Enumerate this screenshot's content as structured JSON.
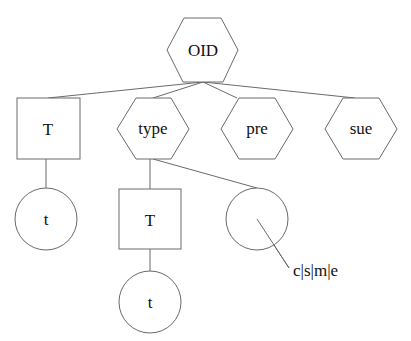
{
  "diagram": {
    "type": "tree",
    "nodes": [
      {
        "id": "oid",
        "shape": "hexagon",
        "label": "OID"
      },
      {
        "id": "T1",
        "shape": "square",
        "label": "T"
      },
      {
        "id": "type",
        "shape": "hexagon",
        "label": "type"
      },
      {
        "id": "pre",
        "shape": "hexagon",
        "label": "pre"
      },
      {
        "id": "sue",
        "shape": "hexagon",
        "label": "sue"
      },
      {
        "id": "t1",
        "shape": "circle",
        "label": "t"
      },
      {
        "id": "T2",
        "shape": "square",
        "label": "T"
      },
      {
        "id": "empty",
        "shape": "circle",
        "label": ""
      },
      {
        "id": "t2",
        "shape": "circle",
        "label": "t"
      }
    ],
    "edges": [
      [
        "oid",
        "T1"
      ],
      [
        "oid",
        "type"
      ],
      [
        "oid",
        "pre"
      ],
      [
        "oid",
        "sue"
      ],
      [
        "T1",
        "t1"
      ],
      [
        "type",
        "T2"
      ],
      [
        "type",
        "empty"
      ],
      [
        "T2",
        "t2"
      ]
    ],
    "annotation": {
      "target": "empty",
      "label": "c|s|m|e"
    },
    "colors": {
      "stroke": "#6a6a6a",
      "text": "#111111",
      "background": "#ffffff"
    }
  }
}
